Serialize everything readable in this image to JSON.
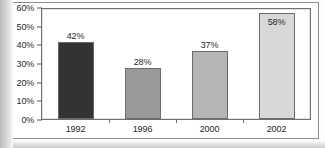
{
  "figure": {
    "clipped_caption_text": "· · · ·",
    "frame_color": "#8e8e8e",
    "plot_frame_color": "#6f6f6f",
    "background_color": "#ffffff"
  },
  "chart_data": {
    "type": "bar",
    "title": "",
    "xlabel": "",
    "ylabel": "",
    "categories": [
      "1992",
      "1996",
      "2000",
      "2002"
    ],
    "values": [
      42,
      28,
      37,
      58
    ],
    "value_labels": [
      "42%",
      "28%",
      "37%",
      "58%"
    ],
    "label_placement": [
      "outside",
      "outside",
      "outside",
      "inside"
    ],
    "bar_colors": [
      "#333333",
      "#9a9a9a",
      "#b5b5b5",
      "#d8d8d8"
    ],
    "bar_border_color": "#6b6b6b",
    "ylim": [
      0,
      60
    ],
    "ytick_values": [
      60,
      50,
      40,
      30,
      20,
      10,
      0
    ],
    "ytick_labels": [
      "60%",
      "50%",
      "40%",
      "30%",
      "20%",
      "10%",
      "0%"
    ],
    "grid": false,
    "legend": "none"
  }
}
